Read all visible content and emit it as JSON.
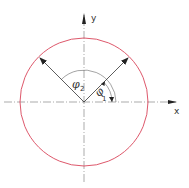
{
  "diagram": {
    "labels": {
      "x_axis": "x",
      "y_axis": "y",
      "angle1_symbol": "φ",
      "angle1_sub": "1",
      "angle2_symbol": "φ",
      "angle2_sub": "2"
    },
    "colors": {
      "circle": "#d9455a",
      "lines": "#333333",
      "axes": "#888888"
    },
    "geometry": {
      "center": [
        84,
        102
      ],
      "radius": 64,
      "vector1_angle_deg": 45,
      "vector2_angle_deg": 135
    }
  }
}
